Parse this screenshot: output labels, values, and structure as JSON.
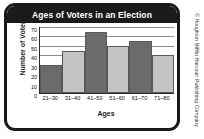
{
  "chart_data": {
    "type": "bar",
    "title": "Ages of Voters in an Election",
    "xlabel": "Ages",
    "ylabel": "Number of Voters",
    "categories": [
      "21–30",
      "31–40",
      "41–50",
      "51–60",
      "61–70",
      "71–80"
    ],
    "values": [
      30,
      45,
      65,
      50,
      55,
      40
    ],
    "bar_colors": [
      "#6b6b6b",
      "#c4c4c4",
      "#6b6b6b",
      "#c4c4c4",
      "#6b6b6b",
      "#c4c4c4"
    ],
    "ylim": [
      0,
      70
    ],
    "yticks": [
      0,
      10,
      20,
      30,
      40,
      50,
      60,
      70
    ],
    "gridlines": [
      70,
      60,
      50,
      40,
      30,
      20,
      10
    ],
    "grid": true,
    "legend": "none"
  },
  "colors": {
    "frame": "#1a1a1a",
    "title_bar": "#1a1a1a",
    "title_text": "#ffffff",
    "bar_dark": "#6b6b6b",
    "bar_light": "#c4c4c4",
    "gridline": "#8c8c8c",
    "plot_background": "#ffffff"
  },
  "credit": {
    "text": "© Houghton Mifflin Harcourt Publishing Company"
  }
}
